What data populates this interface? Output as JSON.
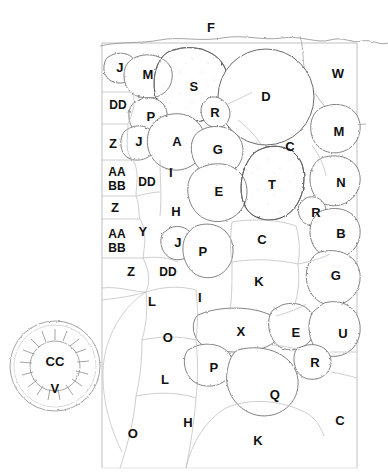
{
  "plan": {
    "title": "Planting Plan Diagram",
    "frame": {
      "x": 102,
      "y": 43,
      "width": 255,
      "height": 425,
      "stroke": "#9a9a9a"
    },
    "colors": {
      "outline": "#6f6f6f",
      "bed_outline": "#5e5e5e",
      "fine_line": "#b4b4b4",
      "label": "#111111",
      "background": "#ffffff",
      "stipple": "#cccccc"
    },
    "labels": [
      {
        "text": "F",
        "x": 211,
        "y": 27,
        "size": 13
      },
      {
        "text": "J",
        "x": 120,
        "y": 67,
        "size": 13
      },
      {
        "text": "M",
        "x": 148,
        "y": 74,
        "size": 13
      },
      {
        "text": "S",
        "x": 194,
        "y": 86,
        "size": 13
      },
      {
        "text": "D",
        "x": 266,
        "y": 96,
        "size": 13
      },
      {
        "text": "W",
        "x": 338,
        "y": 73,
        "size": 13
      },
      {
        "text": "DD",
        "x": 118,
        "y": 105,
        "size": 12
      },
      {
        "text": "P",
        "x": 151,
        "y": 116,
        "size": 13
      },
      {
        "text": "R",
        "x": 215,
        "y": 112,
        "size": 13
      },
      {
        "text": "M",
        "x": 339,
        "y": 131,
        "size": 13
      },
      {
        "text": "Z",
        "x": 113,
        "y": 143,
        "size": 13
      },
      {
        "text": "J",
        "x": 139,
        "y": 141,
        "size": 13
      },
      {
        "text": "A",
        "x": 177,
        "y": 141,
        "size": 13
      },
      {
        "text": "G",
        "x": 218,
        "y": 149,
        "size": 13
      },
      {
        "text": "C",
        "x": 290,
        "y": 146,
        "size": 13
      },
      {
        "text": "AA",
        "x": 117,
        "y": 172,
        "size": 12
      },
      {
        "text": "BB",
        "x": 117,
        "y": 186,
        "size": 12
      },
      {
        "text": "DD",
        "x": 147,
        "y": 182,
        "size": 12
      },
      {
        "text": "I",
        "x": 171,
        "y": 172,
        "size": 13
      },
      {
        "text": "E",
        "x": 219,
        "y": 191,
        "size": 13
      },
      {
        "text": "T",
        "x": 272,
        "y": 184,
        "size": 13
      },
      {
        "text": "N",
        "x": 341,
        "y": 182,
        "size": 13
      },
      {
        "text": "Z",
        "x": 115,
        "y": 207,
        "size": 13
      },
      {
        "text": "H",
        "x": 176,
        "y": 211,
        "size": 13
      },
      {
        "text": "R",
        "x": 316,
        "y": 212,
        "size": 13
      },
      {
        "text": "AA",
        "x": 117,
        "y": 234,
        "size": 12
      },
      {
        "text": "BB",
        "x": 117,
        "y": 248,
        "size": 12
      },
      {
        "text": "Y",
        "x": 143,
        "y": 231,
        "size": 13
      },
      {
        "text": "J",
        "x": 178,
        "y": 242,
        "size": 13
      },
      {
        "text": "P",
        "x": 203,
        "y": 251,
        "size": 13
      },
      {
        "text": "C",
        "x": 262,
        "y": 239,
        "size": 13
      },
      {
        "text": "B",
        "x": 341,
        "y": 233,
        "size": 13
      },
      {
        "text": "Z",
        "x": 131,
        "y": 271,
        "size": 13
      },
      {
        "text": "DD",
        "x": 168,
        "y": 272,
        "size": 12
      },
      {
        "text": "K",
        "x": 259,
        "y": 281,
        "size": 13
      },
      {
        "text": "G",
        "x": 336,
        "y": 275,
        "size": 13
      },
      {
        "text": "L",
        "x": 152,
        "y": 301,
        "size": 13
      },
      {
        "text": "I",
        "x": 200,
        "y": 297,
        "size": 13
      },
      {
        "text": "O",
        "x": 168,
        "y": 337,
        "size": 13
      },
      {
        "text": "X",
        "x": 241,
        "y": 331,
        "size": 13
      },
      {
        "text": "E",
        "x": 296,
        "y": 332,
        "size": 13
      },
      {
        "text": "U",
        "x": 343,
        "y": 333,
        "size": 13
      },
      {
        "text": "CC",
        "x": 55,
        "y": 361,
        "size": 13
      },
      {
        "text": "P",
        "x": 214,
        "y": 367,
        "size": 13
      },
      {
        "text": "R",
        "x": 315,
        "y": 362,
        "size": 13
      },
      {
        "text": "L",
        "x": 165,
        "y": 379,
        "size": 13
      },
      {
        "text": "V",
        "x": 55,
        "y": 388,
        "size": 13
      },
      {
        "text": "Q",
        "x": 275,
        "y": 394,
        "size": 13
      },
      {
        "text": "H",
        "x": 188,
        "y": 422,
        "size": 13
      },
      {
        "text": "O",
        "x": 133,
        "y": 433,
        "size": 13
      },
      {
        "text": "C",
        "x": 340,
        "y": 420,
        "size": 13
      },
      {
        "text": "K",
        "x": 258,
        "y": 440,
        "size": 13
      }
    ],
    "legend_circle": {
      "name": "specimen-tree-cc-v",
      "cx": 55,
      "cy": 366,
      "r_outer": 46,
      "r_inner": 26
    }
  }
}
